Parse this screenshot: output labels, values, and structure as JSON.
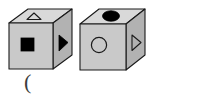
{
  "figure": {
    "background_color": "#ffffff",
    "outline_color": "#1a1a1a",
    "face_colors": {
      "top": "#d9d9d9",
      "front": "#c9c9c9",
      "right": "#b2b2b2"
    },
    "fill_color": "#000000"
  },
  "cubes": [
    {
      "id": "cube-left",
      "label": "left cube",
      "faces": {
        "top": {
          "symbol": "triangle",
          "symbol_name": "triangle-outline",
          "style": "outline"
        },
        "front": {
          "symbol": "square",
          "symbol_name": "square-filled",
          "style": "filled"
        },
        "right": {
          "symbol": "triangle-right",
          "symbol_name": "triangle-right-filled",
          "style": "filled"
        }
      }
    },
    {
      "id": "cube-right",
      "label": "right cube",
      "faces": {
        "top": {
          "symbol": "ellipse",
          "symbol_name": "ellipse-filled",
          "style": "filled"
        },
        "front": {
          "symbol": "circle",
          "symbol_name": "circle-outline",
          "style": "outline"
        },
        "right": {
          "symbol": "triangle-right",
          "symbol_name": "triangle-right-outline",
          "style": "outline"
        }
      }
    }
  ],
  "annotations": {
    "paren": "("
  }
}
